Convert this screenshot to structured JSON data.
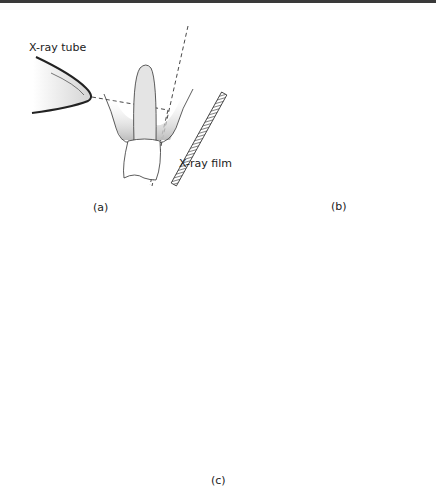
{
  "figure": {
    "panels": [
      {
        "id": "a",
        "caption": "(a)",
        "labels": {
          "tube": "X-ray tube",
          "film": "X-ray film"
        },
        "description": "Bisecting angle technique, upper incisor"
      },
      {
        "id": "b",
        "caption": "(b)",
        "description": "Occlusal view of beam directed perpendicular to film through molars"
      },
      {
        "id": "c",
        "caption": "(c)",
        "description": "Bitewing: upper and lower teeth occluding on a bite tab attached to film"
      }
    ]
  },
  "colors": {
    "line": "#222222",
    "shade": "#d9d9d9",
    "border": "#3a3a3a"
  }
}
